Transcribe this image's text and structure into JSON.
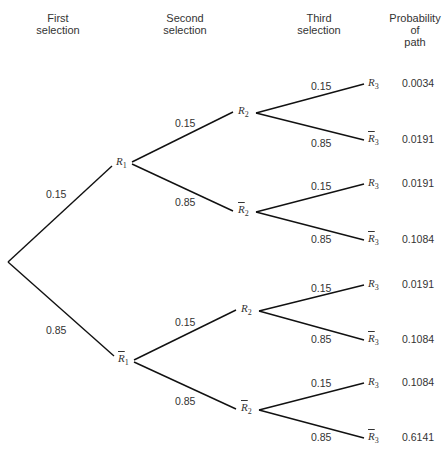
{
  "headers": {
    "first": [
      "First",
      "selection"
    ],
    "second": [
      "Second",
      "selection"
    ],
    "third": [
      "Third",
      "selection"
    ],
    "prob": [
      "Probability",
      "of",
      "path"
    ]
  },
  "nodes": {
    "r1": {
      "letter": "R",
      "sub": "1",
      "bar": false
    },
    "r1bar": {
      "letter": "R",
      "sub": "1",
      "bar": true
    },
    "r2a": {
      "letter": "R",
      "sub": "2",
      "bar": false
    },
    "r2abar": {
      "letter": "R",
      "sub": "2",
      "bar": true
    },
    "r2b": {
      "letter": "R",
      "sub": "2",
      "bar": false
    },
    "r2bbar": {
      "letter": "R",
      "sub": "2",
      "bar": true
    },
    "leaves": [
      {
        "letter": "R",
        "sub": "3",
        "bar": false
      },
      {
        "letter": "R",
        "sub": "3",
        "bar": true
      },
      {
        "letter": "R",
        "sub": "3",
        "bar": false
      },
      {
        "letter": "R",
        "sub": "3",
        "bar": true
      },
      {
        "letter": "R",
        "sub": "3",
        "bar": false
      },
      {
        "letter": "R",
        "sub": "3",
        "bar": true
      },
      {
        "letter": "R",
        "sub": "3",
        "bar": false
      },
      {
        "letter": "R",
        "sub": "3",
        "bar": true
      }
    ]
  },
  "edge_labels": {
    "level1": [
      "0.15",
      "0.85"
    ],
    "level2": [
      "0.15",
      "0.85",
      "0.15",
      "0.85"
    ],
    "level3": [
      "0.15",
      "0.85",
      "0.15",
      "0.85",
      "0.15",
      "0.85",
      "0.15",
      "0.85"
    ]
  },
  "path_probabilities": [
    "0.0034",
    "0.0191",
    "0.0191",
    "0.1084",
    "0.0191",
    "0.1084",
    "0.1084",
    "0.6141"
  ]
}
